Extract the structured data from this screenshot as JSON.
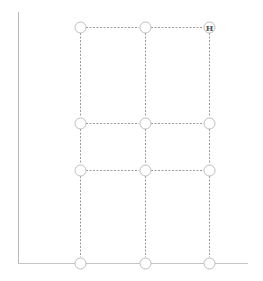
{
  "diagram": {
    "type": "grid-graph",
    "columns_x": [
      80,
      145,
      209
    ],
    "rows_y": [
      27,
      123,
      170,
      263
    ],
    "nodes": [
      {
        "id": "r0c0",
        "col": 0,
        "row": 0,
        "label": ""
      },
      {
        "id": "r0c1",
        "col": 1,
        "row": 0,
        "label": ""
      },
      {
        "id": "r0c2",
        "col": 2,
        "row": 0,
        "label": "H"
      },
      {
        "id": "r1c0",
        "col": 0,
        "row": 1,
        "label": ""
      },
      {
        "id": "r1c1",
        "col": 1,
        "row": 1,
        "label": ""
      },
      {
        "id": "r1c2",
        "col": 2,
        "row": 1,
        "label": ""
      },
      {
        "id": "r2c0",
        "col": 0,
        "row": 2,
        "label": ""
      },
      {
        "id": "r2c1",
        "col": 1,
        "row": 2,
        "label": ""
      },
      {
        "id": "r2c2",
        "col": 2,
        "row": 2,
        "label": ""
      },
      {
        "id": "r3c0",
        "col": 0,
        "row": 3,
        "label": ""
      },
      {
        "id": "r3c1",
        "col": 1,
        "row": 3,
        "label": ""
      },
      {
        "id": "r3c2",
        "col": 2,
        "row": 3,
        "label": ""
      }
    ],
    "highlight_label": "H",
    "colors": {
      "axis": "#b8b8b8",
      "edge": "#9a9a9a",
      "node_stroke": "#bdbdbd"
    }
  }
}
